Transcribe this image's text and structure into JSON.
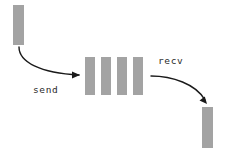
{
  "diagram": {
    "canvas": {
      "width": 227,
      "height": 158,
      "background": "#ffffff"
    },
    "style": {
      "node_fill": "#a3a3a3",
      "arrow_color": "#1a1a1a",
      "label_color": "#2b2b2b"
    },
    "nodes": [
      {
        "id": "source-message",
        "role": "source",
        "x": 13,
        "y": 5,
        "width": 11,
        "height": 40,
        "fill": "#a3a3a3"
      },
      {
        "id": "queue-slot-1",
        "role": "queue-slot",
        "x": 85,
        "y": 57,
        "width": 10,
        "height": 38,
        "fill": "#a3a3a3"
      },
      {
        "id": "queue-slot-2",
        "role": "queue-slot",
        "x": 101,
        "y": 57,
        "width": 10,
        "height": 38,
        "fill": "#a3a3a3"
      },
      {
        "id": "queue-slot-3",
        "role": "queue-slot",
        "x": 117,
        "y": 57,
        "width": 10,
        "height": 38,
        "fill": "#a3a3a3"
      },
      {
        "id": "queue-slot-4",
        "role": "queue-slot",
        "x": 133,
        "y": 57,
        "width": 10,
        "height": 38,
        "fill": "#a3a3a3"
      },
      {
        "id": "destination-message",
        "role": "destination",
        "x": 202,
        "y": 107,
        "width": 11,
        "height": 41,
        "fill": "#a3a3a3"
      }
    ],
    "edges": [
      {
        "id": "send-arrow",
        "label": "send",
        "from": "source-message",
        "to": "queue-slot-1",
        "path": "M 19 47 C 19 62, 40 73, 79 75",
        "head": "80 75 72 71.6 72 78.4",
        "label_x": 33,
        "label_y": 93
      },
      {
        "id": "recv-arrow",
        "label": "recv",
        "from": "queue-slot-4",
        "to": "destination-message",
        "path": "M 151 76 C 172 76, 196 84, 205 100",
        "head": "207 104 199.5 100.6 204.8 96.4",
        "label_x": 158,
        "label_y": 64
      }
    ]
  }
}
